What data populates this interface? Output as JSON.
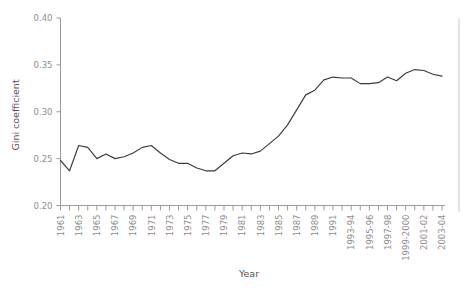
{
  "chart_data": {
    "type": "line",
    "title": "",
    "xlabel": "Year",
    "ylabel": "Gini coefficient",
    "ylim": [
      0.2,
      0.4
    ],
    "ytick_values": [
      0.2,
      0.25,
      0.3,
      0.35,
      0.4
    ],
    "ytick_labels": [
      "0.20",
      "0.25",
      "0.30",
      "0.35",
      "0.40"
    ],
    "grid": false,
    "legend": "none",
    "line_color": "#3b3b3b",
    "axis_color": "#9a9a9a",
    "tick_label_color": "#8d8d8d",
    "x": [
      "1961",
      "1962",
      "1963",
      "1964",
      "1965",
      "1966",
      "1967",
      "1968",
      "1969",
      "1970",
      "1971",
      "1972",
      "1973",
      "1974",
      "1975",
      "1976",
      "1977",
      "1978",
      "1979",
      "1980",
      "1981",
      "1982",
      "1983",
      "1984",
      "1985",
      "1986",
      "1987",
      "1988",
      "1989",
      "1990",
      "1991",
      "1992",
      "1993-94",
      "1994-95",
      "1995-96",
      "1996-97",
      "1997-98",
      "1998-99",
      "1999-2000",
      "2000-01",
      "2001-02",
      "2002-03",
      "2003-04"
    ],
    "xtick_labels_shown": [
      "1961",
      "1963",
      "1965",
      "1967",
      "1969",
      "1971",
      "1973",
      "1975",
      "1977",
      "1979",
      "1981",
      "1983",
      "1985",
      "1987",
      "1989",
      "1991",
      "1993-94",
      "1995-96",
      "1997-98",
      "1999-2000",
      "2001-02",
      "2003-04"
    ],
    "values": [
      0.248,
      0.237,
      0.264,
      0.262,
      0.25,
      0.255,
      0.25,
      0.252,
      0.256,
      0.262,
      0.264,
      0.256,
      0.249,
      0.245,
      0.245,
      0.24,
      0.237,
      0.237,
      0.245,
      0.253,
      0.256,
      0.255,
      0.258,
      0.266,
      0.274,
      0.286,
      0.302,
      0.318,
      0.323,
      0.334,
      0.337,
      0.336,
      0.336,
      0.33,
      0.33,
      0.331,
      0.337,
      0.333,
      0.341,
      0.345,
      0.344,
      0.34,
      0.338
    ]
  },
  "axes": {
    "x_title": "Year",
    "y_title": "Gini coefficient"
  }
}
